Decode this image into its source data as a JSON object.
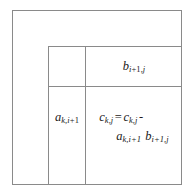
{
  "figure": {
    "line_color": "#8a8a8a",
    "text_color": "#1a1a1a",
    "background": "#ffffff"
  },
  "cells": {
    "corner": {
      "name": "empty-corner-cell",
      "label": ""
    },
    "b_block": {
      "name": "b-row-block",
      "symbol": "b",
      "subscript": "i +1,j",
      "sub_parts": [
        "i",
        "+1,",
        "j"
      ],
      "label": "b i+1,j"
    },
    "a_block": {
      "name": "a-column-block",
      "symbol": "a",
      "subscript": "k,i+1",
      "sub_parts": [
        "k,",
        "i",
        "+1"
      ],
      "label": "a k,i+1"
    },
    "c_block": {
      "name": "c-update-block",
      "line1": {
        "lhs_symbol": "c",
        "lhs_subscript": "k,j",
        "equals": "=",
        "rhs_symbol": "c",
        "rhs_subscript": "k,j",
        "minus": "-"
      },
      "line2": {
        "first_symbol": "a",
        "first_subscript": "k,i+1",
        "second_symbol": "b",
        "second_subscript": "i+1,j"
      },
      "label": "c k,j = c k,j - a k,i+1 b i+1,j"
    }
  }
}
